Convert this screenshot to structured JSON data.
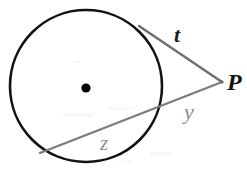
{
  "figure": {
    "type": "geometry-diagram",
    "topic": "circle with tangent and secant from external point",
    "background_color": "#ffffff",
    "labels": {
      "tangent_label": "t",
      "external_point_label": "P",
      "external_secant_segment_label": "y",
      "secant_chord_label": "z"
    },
    "colors": {
      "circle_stroke": "#111111",
      "center_dot": "#000000",
      "tangent_line": "#6a6a6a",
      "secant_line": "#7a7a7a",
      "label_dark": "#1c1c1c",
      "label_gray": "#8a8a8a"
    },
    "geometry": {
      "circle": {
        "cx": 86,
        "cy": 86,
        "r": 76
      },
      "center_dot": {
        "cx": 86,
        "cy": 88,
        "r": 4.5
      },
      "external_point": {
        "x": 222,
        "y": 82
      },
      "tangent_point": {
        "x": 140,
        "y": 27
      },
      "secant_near_intersection": {
        "x": 157,
        "y": 112
      },
      "secant_far_intersection": {
        "x": 42,
        "y": 152
      }
    }
  }
}
